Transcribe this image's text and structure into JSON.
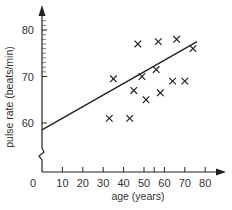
{
  "chart_data": {
    "type": "scatter",
    "title": "",
    "xlabel": "age (years)",
    "ylabel": "pulse rate (beats/min)",
    "xlim": [
      0,
      88
    ],
    "ylim": [
      56,
      83
    ],
    "y_axis_break": true,
    "x_ticks": [
      0,
      10,
      20,
      30,
      40,
      50,
      60,
      70,
      80
    ],
    "x_tick_labels": [
      "0",
      "10",
      "20",
      "30",
      "40",
      "50",
      "60",
      "70",
      "80"
    ],
    "x_minor_ticks": [
      55
    ],
    "y_ticks": [
      60,
      70,
      80
    ],
    "y_tick_labels": [
      "60",
      "70",
      "80"
    ],
    "y_minor_ticks": [
      71,
      72,
      73,
      74,
      75,
      76,
      77,
      78,
      79,
      81,
      82
    ],
    "grid": false,
    "legend": null,
    "marker": "x",
    "points": [
      {
        "x": 33,
        "y": 61
      },
      {
        "x": 43,
        "y": 61
      },
      {
        "x": 35,
        "y": 69.5
      },
      {
        "x": 45,
        "y": 67
      },
      {
        "x": 49,
        "y": 70
      },
      {
        "x": 51,
        "y": 65
      },
      {
        "x": 56,
        "y": 71.5
      },
      {
        "x": 58,
        "y": 66.5
      },
      {
        "x": 47,
        "y": 77
      },
      {
        "x": 57,
        "y": 77.5
      },
      {
        "x": 66,
        "y": 78
      },
      {
        "x": 64,
        "y": 69
      },
      {
        "x": 70,
        "y": 69
      },
      {
        "x": 74,
        "y": 76
      }
    ],
    "trend_line": {
      "x": [
        0,
        76
      ],
      "y": [
        58.5,
        77.5
      ]
    }
  }
}
